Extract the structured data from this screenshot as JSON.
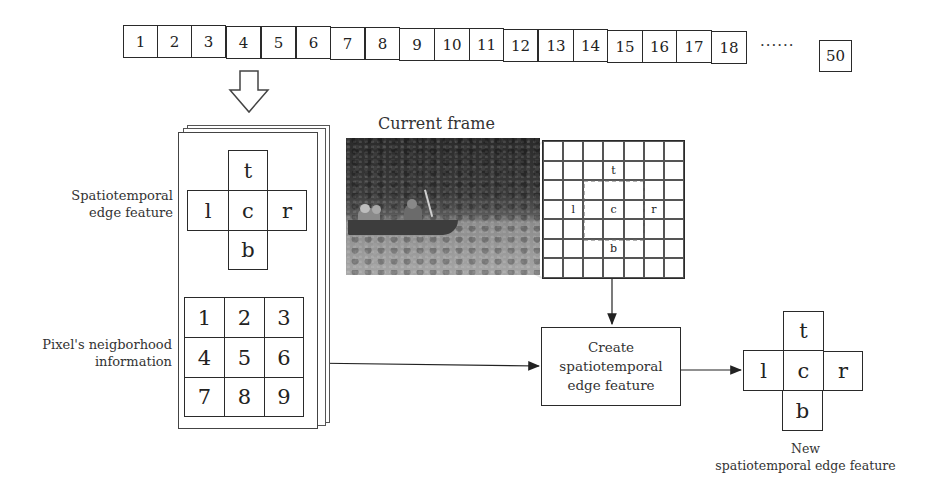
{
  "frame_sequence": {
    "frames": [
      "1",
      "2",
      "3",
      "4",
      "5",
      "6",
      "7",
      "8",
      "9",
      "10",
      "11",
      "12",
      "13",
      "14",
      "15",
      "16",
      "17",
      "18"
    ],
    "ellipsis": "······",
    "last_frame": "50"
  },
  "left_panel": {
    "edge_feature_label_line1": "Spatiotemporal",
    "edge_feature_label_line2": "edge feature",
    "edge_feature": {
      "top": "t",
      "left": "l",
      "center": "c",
      "right": "r",
      "bottom": "b"
    },
    "neighborhood_label_line1": "Pixel's neigborhood",
    "neighborhood_label_line2": "information",
    "neighborhood_grid": [
      "1",
      "2",
      "3",
      "4",
      "5",
      "6",
      "7",
      "8",
      "9"
    ]
  },
  "current_frame": {
    "title": "Current frame",
    "zoom_grid": {
      "size": 7,
      "top": "t",
      "left": "l",
      "center": "c",
      "right": "r",
      "bottom": "b"
    }
  },
  "process": {
    "line1": "Create",
    "line2": "spatiotemporal",
    "line3": "edge feature"
  },
  "output": {
    "edge_feature": {
      "top": "t",
      "left": "l",
      "center": "c",
      "right": "r",
      "bottom": "b"
    },
    "caption_line1": "New",
    "caption_line2": "spatiotemporal edge feature"
  }
}
